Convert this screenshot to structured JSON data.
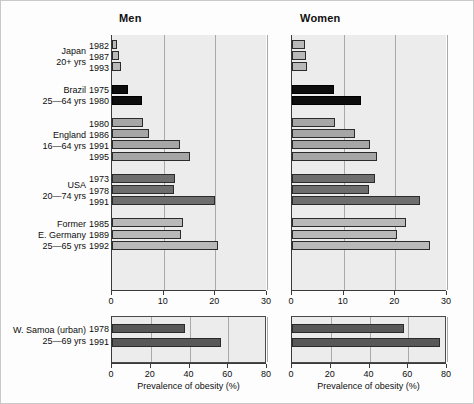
{
  "figure": {
    "panels": [
      {
        "key": "men",
        "label": "Men"
      },
      {
        "key": "women",
        "label": "Women"
      }
    ],
    "axis_title": "Prevalence of obesity (%)"
  },
  "chart_data": {
    "type": "bar",
    "orientation": "horizontal",
    "title": "",
    "xlabel": "Prevalence of obesity (%)",
    "ylabel": "",
    "grid": true,
    "legend": "none",
    "panels": [
      "Men",
      "Women"
    ],
    "main_panel": {
      "xlim": [
        0,
        30
      ],
      "xticks": [
        0,
        10,
        20,
        30
      ],
      "xticklabels": [
        "0",
        "10",
        "20",
        "30"
      ]
    },
    "bottom_panel": {
      "xlim": [
        0,
        80
      ],
      "xticks": [
        0,
        20,
        40,
        60,
        80
      ],
      "xticklabels": [
        "0",
        "20",
        "40",
        "60",
        "80"
      ]
    },
    "groups": [
      {
        "id": "japan",
        "country": "Japan",
        "age_range": "20+ yrs",
        "label_lines": [
          "Japan",
          "20+ yrs"
        ],
        "style": "s-light",
        "panel": "main",
        "rows": [
          {
            "year": "1982",
            "men": 0.9,
            "women": 2.6
          },
          {
            "year": "1987",
            "men": 1.3,
            "women": 2.8
          },
          {
            "year": "1993",
            "men": 1.8,
            "women": 2.9
          }
        ]
      },
      {
        "id": "brazil",
        "country": "Brazil",
        "age_range": "25—64 yrs",
        "label_lines": [
          "Brazil",
          "25—64 yrs"
        ],
        "style": "s-black",
        "panel": "main",
        "rows": [
          {
            "year": "1975",
            "men": 3.1,
            "women": 8.2
          },
          {
            "year": "1980",
            "men": 5.9,
            "women": 13.3
          }
        ]
      },
      {
        "id": "england",
        "country": "England",
        "age_range": "16—64 yrs",
        "label_lines": [
          "England",
          "16—64 yrs"
        ],
        "style": "s-mid",
        "panel": "main",
        "rows": [
          {
            "year": "1980",
            "men": 6.0,
            "women": 8.3
          },
          {
            "year": "1986",
            "men": 7.1,
            "women": 12.1
          },
          {
            "year": "1991",
            "men": 13.1,
            "women": 15.0
          },
          {
            "year": "1995",
            "men": 15.0,
            "women": 16.5
          }
        ]
      },
      {
        "id": "usa",
        "country": "USA",
        "age_range": "20—74 yrs",
        "label_lines": [
          "USA",
          "20—74 yrs"
        ],
        "style": "s-dark",
        "panel": "main",
        "rows": [
          {
            "year": "1973",
            "men": 12.1,
            "women": 16.0
          },
          {
            "year": "1978",
            "men": 12.0,
            "women": 14.9
          },
          {
            "year": "1991",
            "men": 20.0,
            "women": 24.7
          }
        ]
      },
      {
        "id": "east-germany",
        "country": "Former E. Germany",
        "age_range": "25—65 yrs",
        "label_lines": [
          "Former",
          "E. Germany",
          "25—65 yrs"
        ],
        "style": "s-light",
        "panel": "main",
        "rows": [
          {
            "year": "1985",
            "men": 13.7,
            "women": 22.0
          },
          {
            "year": "1989",
            "men": 13.4,
            "women": 20.3
          },
          {
            "year": "1992",
            "men": 20.5,
            "women": 26.8
          }
        ]
      },
      {
        "id": "w-samoa",
        "country": "W. Samoa (urban)",
        "age_range": "25—69 yrs",
        "label_lines": [
          "W. Samoa (urban)",
          "25—69 yrs"
        ],
        "style": "s-samoa",
        "panel": "bottom",
        "rows": [
          {
            "year": "1978",
            "men": 37.5,
            "women": 58.0
          },
          {
            "year": "1991",
            "men": 56.5,
            "women": 76.5
          }
        ]
      }
    ]
  },
  "colors": {
    "panel_background": "#ececec",
    "gridline": "#a9a9a9",
    "bar_light": "#b9b9b9",
    "bar_mid": "#a6a6a6",
    "bar_dark": "#6e6e6e",
    "bar_black": "#0d0d0d",
    "bar_samoa": "#585858",
    "axis": "#3a3a3a"
  }
}
